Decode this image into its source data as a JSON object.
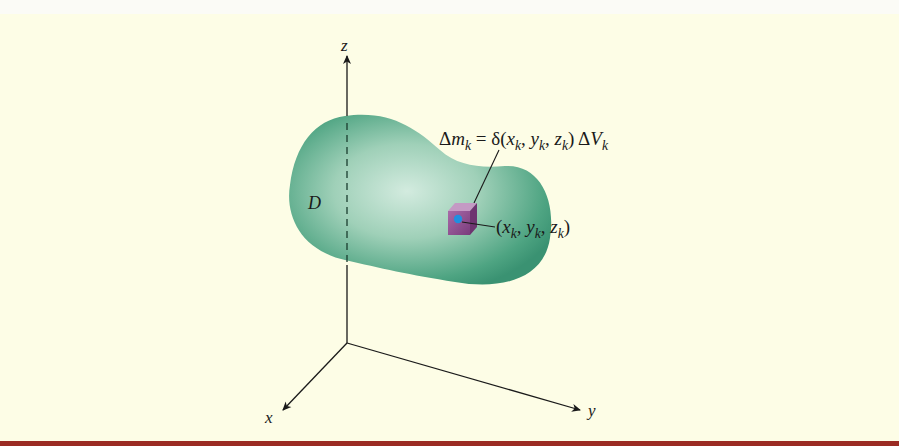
{
  "figure": {
    "axes": {
      "z_label": "z",
      "x_label": "x",
      "y_label": "y"
    },
    "region": {
      "label": "D",
      "fill_color": "#3f9a78",
      "highlight_color": "#cfe9dc"
    },
    "mass_element": {
      "formula": {
        "delta": "Δ",
        "m": "m",
        "sub_k": "k",
        "equals_delta": " = δ(",
        "x": "x",
        "y": "y",
        "z": "z",
        "comma": ", ",
        "close": ") ",
        "V": "V"
      },
      "cube_color": "#8d4a8e",
      "point_color": "#1f8fe0"
    },
    "point_label": {
      "open": "(",
      "x": "x",
      "y": "y",
      "z": "z",
      "sub_k": "k",
      "comma": ", ",
      "close": ")"
    },
    "colors": {
      "background": "#fdfde6",
      "axis": "#1a1a1a",
      "bottom_rule": "#9b2b23"
    }
  }
}
